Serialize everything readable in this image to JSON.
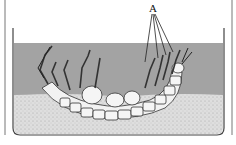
{
  "figure": {
    "labels": [
      {
        "text": "A",
        "x": 150,
        "y": 6
      }
    ],
    "colors": {
      "water": "#a3a3a3",
      "sand": "#d9d9d9",
      "outline": "#333333",
      "body": "#f2f2f2"
    }
  }
}
